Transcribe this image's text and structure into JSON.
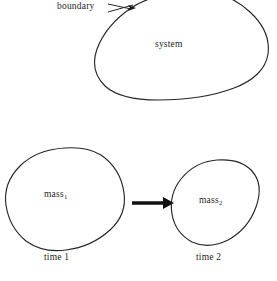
{
  "figure": {
    "background_color": "#ffffff",
    "line_color": "#262626",
    "text_color": "#1f1f1f",
    "width": 277,
    "height": 281
  },
  "upper_diagram": {
    "boundary_label": "boundary",
    "system_label": "system",
    "leader_line": {
      "from": [
        110,
        5
      ],
      "to": [
        134,
        8
      ],
      "has_arrowhead": true,
      "arrow_target": "system-boundary-curve"
    }
  },
  "lower_diagram": {
    "left": {
      "mass_label_base": "mass",
      "mass_label_subscript": "1",
      "time_label": "time 1"
    },
    "right": {
      "mass_label_base": "mass",
      "mass_label_subscript": "2",
      "time_label": "time 2"
    },
    "transition_arrow": {
      "direction": "right",
      "from": [
        132,
        203
      ],
      "to": [
        172,
        203
      ]
    }
  }
}
